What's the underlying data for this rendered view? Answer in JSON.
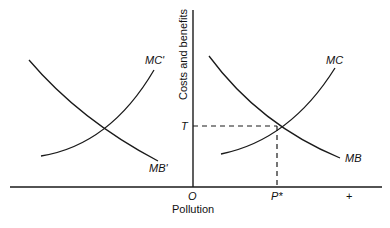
{
  "diagram": {
    "y_axis_label": "Costs and benefits",
    "x_axis_label": "Pollution",
    "origin_label": "O",
    "equilibrium_x_label": "P*",
    "plus_label": "+",
    "equilibrium_y_label": "T",
    "curves": {
      "left_mc": "MC'",
      "left_mb": "MB'",
      "right_mc": "MC",
      "right_mb": "MB"
    },
    "line_color": "#1a1a1a"
  }
}
